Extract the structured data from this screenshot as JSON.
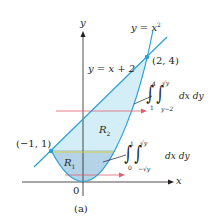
{
  "figure": {
    "caption": "(a)",
    "axes": {
      "x_label": "x",
      "y_label": "y",
      "origin_label": "0"
    },
    "curves": {
      "parabola_label": "y = x",
      "parabola_exponent": "2",
      "line_label": "y = x + 2"
    },
    "points": {
      "upper": "(2, 4)",
      "left": "(−1, 1)"
    },
    "regions": {
      "r1": {
        "letter": "R",
        "sub": "1"
      },
      "r2": {
        "letter": "R",
        "sub": "2"
      }
    },
    "integral_upper": {
      "outer_lower": "1",
      "outer_upper": "4",
      "inner_lower": "y−2",
      "inner_upper": "√y",
      "differentials": "dx dy"
    },
    "integral_lower": {
      "outer_lower": "0",
      "outer_upper": "1",
      "inner_lower": "−√y",
      "inner_upper": "√y",
      "differentials": "dx dy"
    },
    "colors": {
      "curve": "#2a9fd6",
      "region_r2": "#d4eef8",
      "region_r1": "#b5d3e6",
      "divider": "#d8d23a",
      "arrow": "#e0606e",
      "axis": "#231f20"
    }
  }
}
